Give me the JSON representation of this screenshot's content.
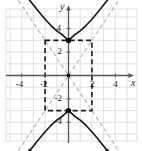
{
  "figure": {
    "name": "hyperbola-graph",
    "background": "#ffffff",
    "width": 142,
    "height": 151
  },
  "axes": {
    "x_axis_label": "x",
    "y_axis_label": "y",
    "x_ticks": [
      "-4",
      "-2",
      "2",
      "4"
    ],
    "y_ticks": [
      "4",
      "2",
      "-2",
      "-4"
    ],
    "x_tick_values": [
      -4,
      -2,
      2,
      4
    ],
    "y_tick_values": [
      4,
      2,
      -2,
      -4
    ],
    "xlim": [
      -5.5,
      5.5
    ],
    "ylim": [
      -5.5,
      5.5
    ],
    "grid": true,
    "grid_color": "#d8d8d8",
    "axis_color": "#555555"
  },
  "chart_data": {
    "type": "line",
    "title": "",
    "subtitle": "",
    "xlabel": "x",
    "ylabel": "y",
    "xlim": [
      -5.5,
      5.5
    ],
    "ylim": [
      -5.5,
      5.5
    ],
    "grid": true,
    "legend": [],
    "annotations": [],
    "equation": "y^2/9 - x^2/4 = 1",
    "curve_type": "hyperbola-vertical",
    "center": [
      0,
      0
    ],
    "a": 3,
    "b": 2,
    "series": [
      {
        "name": "upper-branch",
        "color": "#1a1a1a",
        "x": [
          -5.0,
          -4.5,
          -4.0,
          -3.5,
          -3.0,
          -2.5,
          -2.0,
          -1.5,
          -1.0,
          -0.5,
          0.0,
          0.5,
          1.0,
          1.5,
          2.0,
          2.5,
          3.0,
          3.5,
          4.0,
          4.5,
          5.0
        ],
        "values": [
          8.72,
          8.02,
          7.34,
          6.67,
          6.02,
          5.4,
          4.81,
          4.27,
          3.81,
          3.46,
          3.0,
          3.46,
          3.81,
          4.27,
          4.81,
          5.4,
          6.02,
          6.67,
          7.34,
          8.02,
          8.72
        ]
      },
      {
        "name": "lower-branch",
        "color": "#1a1a1a",
        "x": [
          -5.0,
          -4.5,
          -4.0,
          -3.5,
          -3.0,
          -2.5,
          -2.0,
          -1.5,
          -1.0,
          -0.5,
          0.0,
          0.5,
          1.0,
          1.5,
          2.0,
          2.5,
          3.0,
          3.5,
          4.0,
          4.5,
          5.0
        ],
        "values": [
          -8.72,
          -8.02,
          -7.34,
          -6.67,
          -6.02,
          -5.4,
          -4.81,
          -4.27,
          -3.81,
          -3.46,
          -3.0,
          -3.46,
          -3.81,
          -4.27,
          -4.81,
          -5.4,
          -6.02,
          -6.67,
          -7.34,
          -8.02,
          -8.72
        ]
      }
    ],
    "asymptotes": [
      {
        "name": "asymptote-positive-slope",
        "equation": "y = 1.5x",
        "slope": 1.5,
        "intercept": 0,
        "style": "dashed",
        "color": "#b0b0b0"
      },
      {
        "name": "asymptote-negative-slope",
        "equation": "y = -1.5x",
        "slope": -1.5,
        "intercept": 0,
        "style": "dashed",
        "color": "#b0b0b0"
      }
    ],
    "central_rectangle": {
      "name": "central-rectangle",
      "x_range": [
        -2,
        2
      ],
      "y_range": [
        -3,
        3
      ],
      "style": "dashed",
      "color": "#1a1a1a"
    },
    "points": [
      {
        "name": "vertex-upper",
        "x": 0,
        "y": 3,
        "marker": "filled-circle",
        "color": "#000000"
      },
      {
        "name": "vertex-lower",
        "x": 0,
        "y": -3,
        "marker": "filled-circle",
        "color": "#000000"
      },
      {
        "name": "center-origin",
        "x": 0,
        "y": 0,
        "marker": "filled-circle",
        "color": "#000000"
      }
    ]
  }
}
